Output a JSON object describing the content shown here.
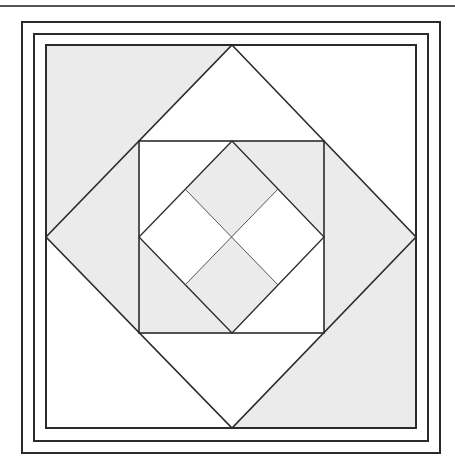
{
  "figure": {
    "colors": {
      "background": "#ffffff",
      "shade": "#ebebeb",
      "line": "#2b2b2b",
      "inner_line": "#555555",
      "rule": "#555555"
    },
    "frames": [
      {
        "name": "outer-frame",
        "x": 22,
        "y": 22,
        "w": 418,
        "h": 431
      },
      {
        "name": "middle-frame",
        "x": 34,
        "y": 34,
        "w": 394,
        "h": 407
      },
      {
        "name": "inner-frame",
        "x": 46,
        "y": 45,
        "w": 370,
        "h": 383
      }
    ],
    "large_diamond": {
      "top": [
        232,
        45
      ],
      "right": [
        416,
        237
      ],
      "bottom": [
        232,
        428
      ],
      "left": [
        46,
        237
      ]
    },
    "inner_square": {
      "x": 139,
      "y": 141,
      "w": 185,
      "h": 192
    },
    "small_diamond": {
      "top": [
        232,
        141
      ],
      "right": [
        324,
        237
      ],
      "bottom": [
        232,
        333
      ],
      "left": [
        139,
        237
      ]
    },
    "center": [
      232,
      237
    ]
  }
}
